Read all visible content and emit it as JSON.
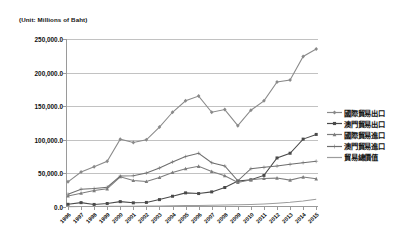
{
  "chart_data": {
    "type": "line",
    "title": "(Unit: Millions of Baht)",
    "xlabel": "",
    "ylabel": "",
    "ylim": [
      0,
      250000
    ],
    "ytick_labels": [
      "250,000.0",
      "200,000.0",
      "150,000.0",
      "100,000.0",
      "50,000.0",
      "0.0"
    ],
    "ytick_values": [
      250000,
      200000,
      150000,
      100000,
      50000,
      0
    ],
    "grid": true,
    "legend_position": "right",
    "categories": [
      "1996",
      "1997",
      "1998",
      "1999",
      "2000",
      "2001",
      "2002",
      "2003",
      "2004",
      "2005",
      "2006",
      "2007",
      "2008",
      "2009",
      "2010",
      "2011",
      "2012",
      "2013",
      "2014",
      "2015"
    ],
    "series": [
      {
        "name": "國際貿易出口",
        "color": "#8a8a8a",
        "marker": "diamond",
        "values": [
          37500,
          52000,
          60000,
          68000,
          101000,
          96000,
          100000,
          119000,
          141000,
          158000,
          165000,
          141000,
          145000,
          121000,
          144000,
          158000,
          186000,
          189000,
          224000,
          235000
        ]
      },
      {
        "name": "澳門貿易出口",
        "color": "#4a4a4a",
        "marker": "square",
        "values": [
          4000,
          6500,
          3800,
          5200,
          8000,
          6200,
          6800,
          11000,
          16000,
          21000,
          20000,
          22500,
          29000,
          38500,
          40500,
          47000,
          73000,
          80000,
          101000,
          108000
        ]
      },
      {
        "name": "國際貿易進口",
        "color": "#7d7d7d",
        "marker": "triangle",
        "values": [
          16500,
          20500,
          24500,
          27000,
          45000,
          39500,
          38000,
          44000,
          51500,
          57000,
          60500,
          53000,
          46500,
          36500,
          40500,
          42500,
          43000,
          40000,
          44500,
          42000
        ]
      },
      {
        "name": "澳門貿易進口",
        "color": "#6e6e6e",
        "marker": "cross",
        "values": [
          19000,
          26500,
          27500,
          29500,
          46000,
          46500,
          50500,
          58000,
          67000,
          75000,
          80000,
          66000,
          61000,
          39000,
          57000,
          59000,
          61000,
          63500,
          66000,
          68000
        ]
      },
      {
        "name": "貿易總價值",
        "color": "#9c9c9c",
        "marker": "none",
        "values": [
          500,
          700,
          800,
          900,
          1100,
          1200,
          1400,
          1600,
          1900,
          2100,
          2300,
          2600,
          2900,
          3200,
          3800,
          4500,
          5600,
          7000,
          9000,
          11500
        ]
      }
    ]
  }
}
